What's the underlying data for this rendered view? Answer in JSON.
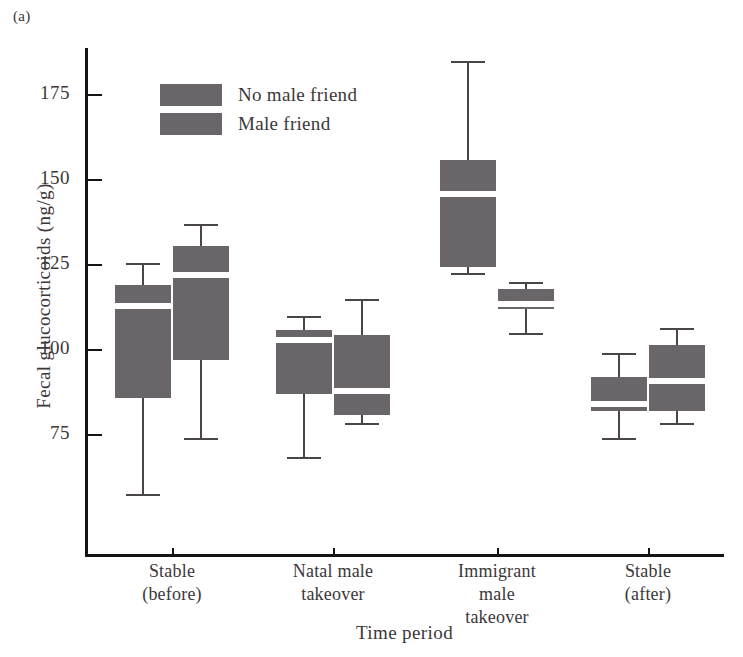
{
  "panel_label": "(a)",
  "chart_data": {
    "type": "box",
    "title": "",
    "xlabel": "Time period",
    "ylabel": "Fecal glucocorticoids (ng/g)",
    "ylim": [
      52,
      190
    ],
    "yticks": [
      75,
      100,
      125,
      150,
      175
    ],
    "ytick_labels": [
      "75",
      "100",
      "125",
      "150",
      "175"
    ],
    "grid": false,
    "legend_position": "upper-left-inside",
    "categories": [
      "Stable\n(before)",
      "Natal male\ntakeover",
      "Immigrant\nmale\ntakeover",
      "Stable\n(after)"
    ],
    "series": [
      {
        "name": "No male friend",
        "color": "#6a6568",
        "boxes": [
          {
            "category": "Stable (before)",
            "whisker_low": 57,
            "q1": 86,
            "median": 113,
            "q3": 119,
            "whisker_high": 125.5
          },
          {
            "category": "Natal male takeover",
            "whisker_low": 68,
            "q1": 87,
            "median": 103,
            "q3": 106,
            "whisker_high": 110
          },
          {
            "category": "Immigrant male takeover",
            "whisker_low": 122,
            "q1": 124.5,
            "median": 146,
            "q3": 156,
            "whisker_high": 185
          },
          {
            "category": "Stable (after)",
            "whisker_low": 73.5,
            "q1": 82,
            "median": 84,
            "q3": 92,
            "whisker_high": 99
          }
        ]
      },
      {
        "name": "Male friend",
        "color": "#6a6568",
        "boxes": [
          {
            "category": "Stable (before)",
            "whisker_low": 73.5,
            "q1": 97,
            "median": 122,
            "q3": 130.5,
            "whisker_high": 137
          },
          {
            "category": "Natal male takeover",
            "whisker_low": 78,
            "q1": 81,
            "median": 88,
            "q3": 104.5,
            "whisker_high": 115
          },
          {
            "category": "Immigrant male takeover",
            "whisker_low": 104.5,
            "q1": 112,
            "median": 113.5,
            "q3": 118,
            "whisker_high": 120
          },
          {
            "category": "Stable (after)",
            "whisker_low": 78,
            "q1": 82,
            "median": 91,
            "q3": 101.5,
            "whisker_high": 106.5
          }
        ]
      }
    ]
  },
  "legend": {
    "items": [
      {
        "label": "No male friend",
        "color": "#6a6568"
      },
      {
        "label": "Male friend",
        "color": "#6a6568"
      }
    ]
  }
}
